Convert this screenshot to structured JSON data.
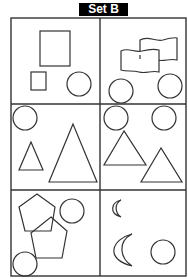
{
  "title": "Set B",
  "colors": {
    "title_bg": "#000000",
    "title_text": "#ffffff",
    "stroke": "#333333",
    "background": "#ffffff"
  },
  "grid": {
    "rows": 3,
    "cols": 2
  },
  "cells": [
    {
      "position": "row1-col1",
      "shapes": [
        "large-square",
        "small-square",
        "circle"
      ]
    },
    {
      "position": "row1-col2",
      "shapes": [
        "flag",
        "flag",
        "circle",
        "circle"
      ]
    },
    {
      "position": "row2-col1",
      "shapes": [
        "circle",
        "small-triangle",
        "large-triangle"
      ]
    },
    {
      "position": "row2-col2",
      "shapes": [
        "circle",
        "circle",
        "triangle",
        "triangle"
      ]
    },
    {
      "position": "row3-col1",
      "shapes": [
        "pentagon",
        "pentagon",
        "circle",
        "circle"
      ]
    },
    {
      "position": "row3-col2",
      "shapes": [
        "small-crescent",
        "large-crescent",
        "circle"
      ]
    }
  ]
}
